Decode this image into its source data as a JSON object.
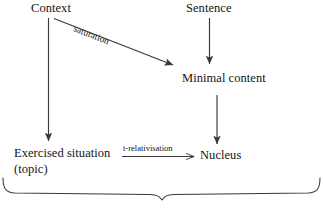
{
  "diagram": {
    "background_color": "#ffffff",
    "stroke_color": "#3a3a3a",
    "text_color": "#141414",
    "nodes": [
      {
        "id": "context",
        "label": "Context"
      },
      {
        "id": "sentence",
        "label": "Sentence"
      },
      {
        "id": "minimal",
        "label": "Minimal content"
      },
      {
        "id": "exercised",
        "label": "Exercised situation"
      },
      {
        "id": "topic",
        "label": "(topic)"
      },
      {
        "id": "nucleus",
        "label": "Nucleus"
      }
    ],
    "edges": [
      {
        "id": "context-to-exercised",
        "from": "Context",
        "to": "Exercised situation",
        "label": ""
      },
      {
        "id": "context-to-minimal",
        "from": "Context",
        "to": "Minimal content",
        "label": "saturation"
      },
      {
        "id": "sentence-to-minimal",
        "from": "Sentence",
        "to": "Minimal content",
        "label": ""
      },
      {
        "id": "minimal-to-nucleus",
        "from": "Minimal content",
        "to": "Nucleus",
        "label": ""
      },
      {
        "id": "exercised-to-nucleus",
        "from": "Exercised situation",
        "to": "Nucleus",
        "label": "t-relativisation"
      }
    ],
    "brace": {
      "id": "bottom-brace",
      "orientation": "down",
      "label": ""
    }
  }
}
